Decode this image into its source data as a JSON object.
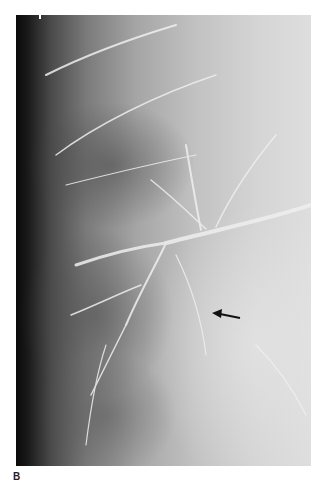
{
  "figure": {
    "panel_label": "B",
    "type": "radiograph",
    "annotation": "arrow-pointing-left"
  }
}
